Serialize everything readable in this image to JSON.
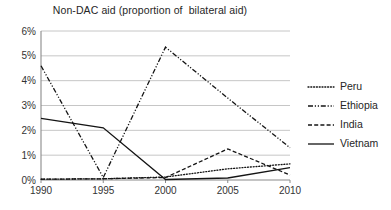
{
  "chart_data": {
    "type": "line",
    "title": "Non-DAC aid (proportion of  bilateral aid)",
    "xlabel": "",
    "ylabel": "",
    "x": [
      1990,
      1995,
      2000,
      2005,
      2010
    ],
    "categories": [
      "1990",
      "1995",
      "2000",
      "2005",
      "2010"
    ],
    "xtick_labels": [
      "1990",
      "1995",
      "2000",
      "2005",
      "2010"
    ],
    "ytick_labels": [
      "0%",
      "1%",
      "2%",
      "3%",
      "4%",
      "5%",
      "6%"
    ],
    "ytick_values": [
      0,
      1,
      2,
      3,
      4,
      5,
      6
    ],
    "ylim": [
      0,
      6
    ],
    "xlim": [
      1990,
      2010
    ],
    "grid": "horizontal",
    "legend_position": "right",
    "units": "percent",
    "series": [
      {
        "name": "Peru",
        "style": "dotted",
        "values": [
          0.03,
          0.05,
          0.12,
          0.45,
          0.65
        ]
      },
      {
        "name": "Ethiopia",
        "style": "dash-dot",
        "values": [
          4.6,
          0.1,
          5.35,
          3.3,
          1.3
        ]
      },
      {
        "name": "India",
        "style": "dashed",
        "values": [
          0.03,
          0.05,
          0.1,
          1.25,
          0.2
        ]
      },
      {
        "name": "Vietnam",
        "style": "solid",
        "values": [
          2.48,
          2.1,
          0.02,
          0.08,
          0.5
        ]
      }
    ]
  },
  "legend": {
    "items": [
      {
        "label": "Peru",
        "style": "dotted"
      },
      {
        "label": "Ethiopia",
        "style": "dash-dot"
      },
      {
        "label": "India",
        "style": "dashed"
      },
      {
        "label": "Vietnam",
        "style": "solid"
      }
    ]
  }
}
